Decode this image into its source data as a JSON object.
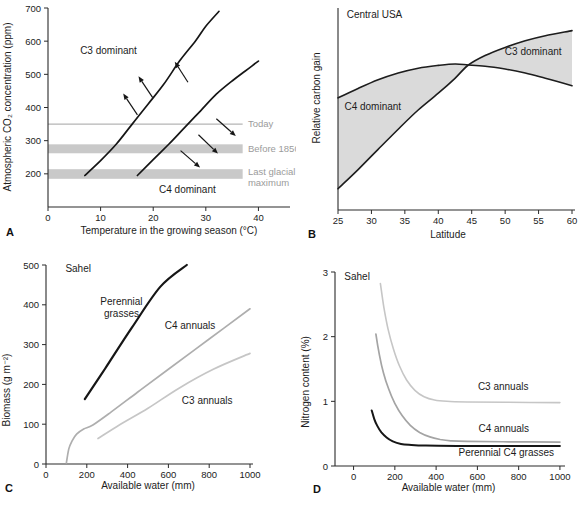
{
  "figure": {
    "panel_letters": [
      "A",
      "B",
      "C",
      "D"
    ]
  },
  "colors": {
    "curve_black": "#161616",
    "annual_gray_light": "#c6c6c6",
    "annual_gray_mid": "#aeaeae",
    "band_gray": "#c9c9c9",
    "today_line_gray": "#b5b5b5",
    "shade_gray": "#dadada",
    "gray_text": "#9b9b9b",
    "axis_color": "#2a2a2a",
    "text_color": "#1c1c1c"
  },
  "chart_data": [
    {
      "id": "A",
      "type": "line",
      "panel_letter": "A",
      "title": "",
      "xlabel": "Temperature in the growing season (°C)",
      "ylabel": "Atmospheric CO₂ concentration (ppm)",
      "size": [
        296,
        252
      ],
      "plot": {
        "left": 48,
        "right": 290,
        "top": 8,
        "bottom": 207
      },
      "xlim": [
        0,
        46
      ],
      "ylim": [
        100,
        700
      ],
      "xticks": [
        0,
        10,
        20,
        30,
        40
      ],
      "yticks": [
        200,
        300,
        400,
        500,
        600,
        700
      ],
      "x_overhang": 0,
      "xlabel_y": 234,
      "ylabel_pos": [
        11,
        107
      ],
      "letter_pos": [
        6,
        236
      ],
      "reference_bands": [
        {
          "kind": "line",
          "label_lines": [
            "Today"
          ],
          "y": 350,
          "x_end": 37,
          "label_x": 38,
          "label_y": 350,
          "color": "#b5b5b5",
          "label_color": "#9b9b9b"
        },
        {
          "kind": "band",
          "label_lines": [
            "Before 1850"
          ],
          "y0": 262,
          "y1": 289,
          "x_end": 37,
          "label_x": 38,
          "label_y": 275,
          "color": "#c9c9c9",
          "label_color": "#9b9b9b"
        },
        {
          "kind": "band",
          "label_lines": [
            "Last glacial",
            "maximum"
          ],
          "y0": 185,
          "y1": 214,
          "x_end": 37,
          "label_x": 38,
          "label_y": 207,
          "color": "#c9c9c9",
          "label_color": "#9b9b9b"
        }
      ],
      "series": [
        {
          "name": "c3-c4-boundary-left",
          "color": "#161616",
          "width": 1.7,
          "points": [
            [
              7,
              195
            ],
            [
              10,
              240
            ],
            [
              13,
              290
            ],
            [
              16,
              350
            ],
            [
              19,
              410
            ],
            [
              22,
              470
            ],
            [
              25,
              540
            ],
            [
              28,
              600
            ],
            [
              30,
              645
            ],
            [
              32.5,
              690
            ]
          ]
        },
        {
          "name": "c3-c4-boundary-right",
          "color": "#161616",
          "width": 1.7,
          "points": [
            [
              17,
              195
            ],
            [
              20,
              243
            ],
            [
              23,
              290
            ],
            [
              26,
              340
            ],
            [
              29,
              390
            ],
            [
              32,
              440
            ],
            [
              35,
              480
            ],
            [
              37.5,
              510
            ],
            [
              40,
              540
            ]
          ]
        }
      ],
      "arrows": [
        {
          "from": [
            17,
            378
          ],
          "to": [
            14.3,
            442
          ]
        },
        {
          "from": [
            19.9,
            430
          ],
          "to": [
            17.2,
            494
          ]
        },
        {
          "from": [
            26.6,
            476
          ],
          "to": [
            24.1,
            538
          ]
        },
        {
          "from": [
            32.0,
            366
          ],
          "to": [
            35.7,
            314
          ]
        },
        {
          "from": [
            28.6,
            318
          ],
          "to": [
            32.3,
            261
          ]
        },
        {
          "from": [
            25.2,
            270
          ],
          "to": [
            28.9,
            219
          ]
        }
      ],
      "annotations": [
        {
          "lines": [
            "C3 dominant"
          ],
          "x": 11.5,
          "y": 562,
          "anchor": "middle",
          "size": 10
        },
        {
          "lines": [
            "C4 dominant"
          ],
          "x": 26.5,
          "y": 143,
          "anchor": "middle",
          "size": 10
        }
      ]
    },
    {
      "id": "B",
      "type": "line",
      "panel_letter": "B",
      "title": "Central USA",
      "xlabel": "Latitude",
      "ylabel": "Relative carbon gain",
      "size": [
        287,
        252
      ],
      "plot": {
        "left": 42,
        "right": 276,
        "top": 8,
        "bottom": 210
      },
      "xlim": [
        25,
        60
      ],
      "ylim": [
        0,
        1
      ],
      "xticks": [
        25,
        30,
        35,
        40,
        45,
        50,
        55,
        60
      ],
      "yticks": [],
      "x_overhang": 3,
      "xlabel_y": 238,
      "xlabel_x": 152,
      "ylabel_pos": [
        24,
        98
      ],
      "letter_pos": [
        12,
        238
      ],
      "shade": {
        "a": "c4-carbon-gain",
        "b": "c3-carbon-gain",
        "split": 44.5,
        "color": "#dadada"
      },
      "series": [
        {
          "name": "c4-carbon-gain",
          "color": "#1d1d1d",
          "width": 1.6,
          "points": [
            [
              25,
              0.555
            ],
            [
              28,
              0.602
            ],
            [
              31,
              0.645
            ],
            [
              34,
              0.678
            ],
            [
              37,
              0.702
            ],
            [
              40,
              0.716
            ],
            [
              42.5,
              0.723
            ],
            [
              44.5,
              0.718
            ],
            [
              47,
              0.712
            ],
            [
              50,
              0.698
            ],
            [
              53,
              0.678
            ],
            [
              56,
              0.652
            ],
            [
              60,
              0.615
            ]
          ]
        },
        {
          "name": "c3-carbon-gain",
          "color": "#1d1d1d",
          "width": 1.6,
          "points": [
            [
              25,
              0.105
            ],
            [
              28,
              0.2
            ],
            [
              31,
              0.3
            ],
            [
              34,
              0.4
            ],
            [
              37,
              0.495
            ],
            [
              40,
              0.578
            ],
            [
              42.5,
              0.652
            ],
            [
              44.5,
              0.718
            ],
            [
              47,
              0.765
            ],
            [
              50,
              0.805
            ],
            [
              53,
              0.838
            ],
            [
              56,
              0.863
            ],
            [
              60,
              0.888
            ]
          ]
        }
      ],
      "arrows": [],
      "annotations": [
        {
          "lines": [
            "Central USA"
          ],
          "x": 26.3,
          "y": 0.95,
          "anchor": "start",
          "size": 10
        },
        {
          "lines": [
            "C4 dominant"
          ],
          "x": 30.2,
          "y": 0.495,
          "anchor": "middle",
          "size": 10
        },
        {
          "lines": [
            "C3 dominant"
          ],
          "x": 54.2,
          "y": 0.765,
          "anchor": "middle",
          "size": 10
        }
      ]
    },
    {
      "id": "C",
      "type": "line",
      "panel_letter": "C",
      "title": "Sahel",
      "xlabel": "Available water (mm)",
      "ylabel": "Biomass (g m⁻²)",
      "size": [
        296,
        253
      ],
      "plot": {
        "left": 46,
        "right": 250,
        "top": 13,
        "bottom": 212
      },
      "xlim": [
        0,
        1000
      ],
      "ylim": [
        0,
        500
      ],
      "xticks": [
        0,
        200,
        400,
        600,
        800,
        1000
      ],
      "yticks": [
        0,
        100,
        200,
        300,
        400,
        500
      ],
      "x_overhang": 3,
      "xlabel_y": 237,
      "ylabel_pos": [
        10,
        138
      ],
      "letter_pos": [
        5,
        240
      ],
      "series": [
        {
          "name": "perennial-grasses",
          "color": "#161616",
          "width": 2.2,
          "points": [
            [
              190,
              163
            ],
            [
              290,
              240
            ],
            [
              420,
              342
            ],
            [
              560,
              445
            ],
            [
              690,
              500
            ]
          ]
        },
        {
          "name": "c4-annuals-biomass",
          "color": "#aeaeae",
          "width": 1.7,
          "points": [
            [
              100,
              3
            ],
            [
              112,
              38
            ],
            [
              128,
              58
            ],
            [
              150,
              75
            ],
            [
              185,
              88
            ],
            [
              230,
              98
            ],
            [
              320,
              131
            ],
            [
              450,
              181
            ],
            [
              600,
              238
            ],
            [
              800,
              314
            ],
            [
              1000,
              390
            ]
          ]
        },
        {
          "name": "c3-annuals-biomass",
          "color": "#c6c6c6",
          "width": 1.7,
          "points": [
            [
              255,
              64
            ],
            [
              350,
              95
            ],
            [
              500,
              140
            ],
            [
              650,
              190
            ],
            [
              820,
              238
            ],
            [
              1000,
              278
            ]
          ]
        }
      ],
      "arrows": [],
      "annotations": [
        {
          "lines": [
            "Sahel"
          ],
          "x": 95,
          "y": 483,
          "anchor": "start",
          "size": 10
        },
        {
          "lines": [
            "Perennial",
            "grasses"
          ],
          "x": 370,
          "y": 400,
          "anchor": "middle",
          "size": 10
        },
        {
          "lines": [
            "C4 annuals"
          ],
          "x": 706,
          "y": 339,
          "anchor": "middle",
          "size": 10
        },
        {
          "lines": [
            "C3 annuals"
          ],
          "x": 790,
          "y": 152,
          "anchor": "middle",
          "size": 10
        }
      ]
    },
    {
      "id": "D",
      "type": "line",
      "panel_letter": "D",
      "title": "Sahel",
      "xlabel": "Available water (mm)",
      "ylabel": "Nitrogen content (%)",
      "size": [
        287,
        253
      ],
      "plot": {
        "left": 39,
        "right": 266,
        "top": 20,
        "bottom": 214
      },
      "xlim": [
        -90,
        1010
      ],
      "ylim": [
        0,
        3
      ],
      "xticks": [
        0,
        200,
        400,
        600,
        800,
        1000
      ],
      "yticks": [
        0,
        1,
        2,
        3
      ],
      "x_overhang": 3,
      "xlabel_y": 239,
      "ylabel_pos": [
        13,
        130
      ],
      "letter_pos": [
        17,
        241
      ],
      "series": [
        {
          "name": "c3-annuals-nitrogen",
          "color": "#c6c6c6",
          "width": 1.6,
          "points": [
            [
              130,
              2.82
            ],
            [
              147,
              2.45
            ],
            [
              167,
              2.12
            ],
            [
              192,
              1.82
            ],
            [
              222,
              1.55
            ],
            [
              257,
              1.33
            ],
            [
              297,
              1.17
            ],
            [
              342,
              1.07
            ],
            [
              392,
              1.02
            ],
            [
              452,
              1.0
            ],
            [
              550,
              0.99
            ],
            [
              750,
              0.985
            ],
            [
              1000,
              0.98
            ]
          ]
        },
        {
          "name": "c4-annuals-nitrogen",
          "color": "#a4a4a4",
          "width": 1.7,
          "points": [
            [
              108,
              2.04
            ],
            [
              125,
              1.72
            ],
            [
              145,
              1.44
            ],
            [
              170,
              1.19
            ],
            [
              200,
              0.97
            ],
            [
              235,
              0.78
            ],
            [
              275,
              0.63
            ],
            [
              320,
              0.52
            ],
            [
              370,
              0.45
            ],
            [
              420,
              0.41
            ],
            [
              470,
              0.39
            ],
            [
              550,
              0.38
            ],
            [
              750,
              0.375
            ],
            [
              1000,
              0.37
            ]
          ]
        },
        {
          "name": "perennial-c4-grasses-nitrogen",
          "color": "#161616",
          "width": 2.0,
          "points": [
            [
              88,
              0.86
            ],
            [
              100,
              0.73
            ],
            [
              115,
              0.62
            ],
            [
              135,
              0.52
            ],
            [
              160,
              0.44
            ],
            [
              190,
              0.38
            ],
            [
              230,
              0.34
            ],
            [
              280,
              0.325
            ],
            [
              350,
              0.315
            ],
            [
              500,
              0.31
            ],
            [
              750,
              0.31
            ],
            [
              1000,
              0.31
            ]
          ]
        }
      ],
      "arrows": [],
      "annotations": [
        {
          "lines": [
            "Sahel"
          ],
          "x": -45,
          "y": 2.87,
          "anchor": "start",
          "size": 10
        },
        {
          "lines": [
            "C3 annuals"
          ],
          "x": 725,
          "y": 1.17,
          "anchor": "middle",
          "size": 10
        },
        {
          "lines": [
            "C4 annuals"
          ],
          "x": 728,
          "y": 0.52,
          "anchor": "middle",
          "size": 10
        },
        {
          "lines": [
            "Perennial C4 grasses"
          ],
          "x": 740,
          "y": 0.155,
          "anchor": "middle",
          "size": 10
        }
      ]
    }
  ]
}
